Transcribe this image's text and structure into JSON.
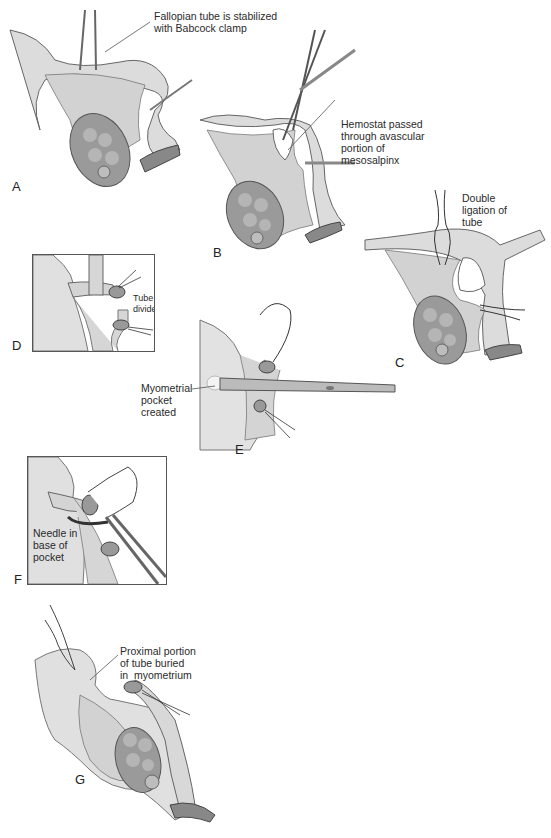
{
  "figure": {
    "colors": {
      "tissue": "#d8d8d8",
      "tissue_dark": "#a9a9a9",
      "ovary": "#9a9a9a",
      "outline": "#555555",
      "instrument": "#6f6f6f",
      "background": "#ffffff"
    },
    "panels": [
      {
        "letter": "A",
        "label": "Fallopian tube is stabilized\nwith Babcock clamp"
      },
      {
        "letter": "B",
        "label": "Hemostat passed\nthrough avascular\nportion of\nmesosalpinx"
      },
      {
        "letter": "C",
        "label": "Double\nligation of\ntube"
      },
      {
        "letter": "D",
        "label": "Tube\ndivided"
      },
      {
        "letter": "E",
        "label": "Myometrial\npocket\ncreated"
      },
      {
        "letter": "F",
        "label": "Needle in\nbase of\npocket"
      },
      {
        "letter": "G",
        "label": "Proximal portion\nof tube buried\nin  myometrium"
      }
    ]
  }
}
